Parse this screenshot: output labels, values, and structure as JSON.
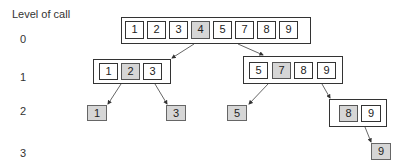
{
  "title": "Level of call",
  "levels": [
    "0",
    "1",
    "2",
    "3"
  ],
  "colors": {
    "pivot_fill": "#d6d6d6",
    "border": "#333333",
    "arrow": "#555555"
  },
  "nodes": {
    "l0": {
      "cells": [
        "1",
        "2",
        "3",
        "4",
        "5",
        "7",
        "8",
        "9"
      ],
      "pivot": "4"
    },
    "l1_left": {
      "cells": [
        "1",
        "2",
        "3"
      ],
      "pivot": "2"
    },
    "l1_right": {
      "cells": [
        "5",
        "7",
        "8",
        "9"
      ],
      "pivot": "7"
    },
    "l2_leaf_1": {
      "cells": [
        "1"
      ]
    },
    "l2_leaf_3": {
      "cells": [
        "3"
      ]
    },
    "l2_leaf_5": {
      "cells": [
        "5"
      ]
    },
    "l2_right": {
      "cells": [
        "8",
        "9"
      ],
      "pivot": "8"
    },
    "l3_leaf_9": {
      "cells": [
        "9"
      ]
    }
  }
}
